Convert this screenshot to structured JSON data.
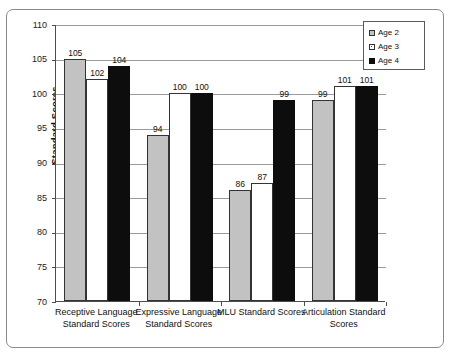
{
  "chart_data": {
    "type": "bar",
    "title": "",
    "xlabel": "",
    "ylabel": "Standard Scores",
    "ylim": [
      70,
      110
    ],
    "ytick_step": 5,
    "yticks": [
      110,
      105,
      100,
      95,
      90,
      85,
      80,
      75,
      70
    ],
    "ytick_labels": [
      "110",
      "105",
      "100",
      "95",
      "90",
      "85",
      "80",
      "75",
      "70"
    ],
    "grid": true,
    "grid_axis": "y",
    "legend_position": "top-right-inside",
    "categories": [
      "Receptive Language Standard Scores",
      "Expressive Language Standard Scores",
      "MLU Standard Scores",
      "Articulation Standard Scores"
    ],
    "category_lines": [
      [
        "Receptive Language",
        "Standard Scores"
      ],
      [
        "Expressive Language",
        "Standard Scores"
      ],
      [
        "MLU Standard Scores",
        ""
      ],
      [
        "Articulation Standard",
        "Scores"
      ]
    ],
    "series": [
      {
        "name": "Age 2",
        "color": "#c2c2c2",
        "pattern": "solid-gray",
        "values": [
          105,
          94,
          86,
          99
        ]
      },
      {
        "name": "Age 3",
        "color": "#ffffff",
        "pattern": "dotted",
        "values": [
          102,
          100,
          87,
          101
        ]
      },
      {
        "name": "Age 4",
        "color": "#0d0d0d",
        "pattern": "solid-black",
        "values": [
          104,
          100,
          99,
          101
        ]
      }
    ],
    "data_labels": [
      [
        "105",
        "102",
        "104"
      ],
      [
        "94",
        "100",
        "100"
      ],
      [
        "86",
        "87",
        "99"
      ],
      [
        "99",
        "101",
        "101"
      ]
    ]
  },
  "legend": {
    "items": [
      {
        "label": "Age 2"
      },
      {
        "label": "Age 3"
      },
      {
        "label": "Age 4"
      }
    ]
  },
  "axis": {
    "y_title": "Standard Scores"
  }
}
